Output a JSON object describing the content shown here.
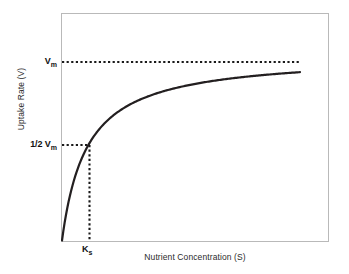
{
  "chart_data": {
    "type": "line",
    "title": "",
    "subtitle": "",
    "xlabel": "Nutrient Concentration (S)",
    "ylabel": "Uptake Rate (V)",
    "grid": false,
    "legend": null,
    "axes": {
      "x_ticks": [
        "K"
      ],
      "x_tick_subscripts": [
        "s"
      ],
      "y_ticks": [
        "V",
        "1/2 V"
      ],
      "y_tick_subscripts": [
        "m",
        "m"
      ],
      "xlim": [
        0,
        1
      ],
      "ylim": [
        0,
        1
      ],
      "tick_marks_shown": false,
      "numeric_ticks_shown": false
    },
    "model": "Michaelis-Menten saturation (Monod) curve",
    "equation": "V = Vm * S / (Ks + S)",
    "parameters": {
      "Vm_normalized": 1.0,
      "Ks_normalized": 0.105,
      "half_saturation_y": 0.5
    },
    "series": [
      {
        "name": "Uptake rate",
        "style": "solid",
        "color": "#231f20",
        "x": [
          0.0,
          0.01,
          0.02,
          0.03,
          0.05,
          0.07,
          0.105,
          0.14,
          0.18,
          0.23,
          0.3,
          0.38,
          0.47,
          0.58,
          0.7,
          0.82,
          0.9,
          1.0
        ],
        "y": [
          0.0,
          0.087,
          0.16,
          0.222,
          0.323,
          0.4,
          0.5,
          0.571,
          0.632,
          0.687,
          0.741,
          0.784,
          0.817,
          0.847,
          0.87,
          0.886,
          0.895,
          0.905
        ]
      }
    ],
    "annotations": [
      {
        "name": "vmax-guide",
        "style": "dotted",
        "orientation": "horizontal",
        "label": "Vm",
        "y_value": 1.0,
        "x_from": 0.0,
        "x_to": 0.905
      },
      {
        "name": "half-vmax-guide",
        "style": "dotted",
        "orientation": "horizontal",
        "label": "1/2 Vm",
        "y_value": 0.5,
        "x_from": 0.0,
        "x_to": 0.105
      },
      {
        "name": "ks-guide",
        "style": "dotted",
        "orientation": "vertical",
        "label": "Ks",
        "x_value": 0.105,
        "y_from": 0.0,
        "y_to": 0.5
      }
    ]
  },
  "labels": {
    "x_axis_title": "Nutrient Concentration (S)",
    "y_axis_title": "Uptake Rate (V)",
    "vmax_main": "V",
    "vmax_sub": "m",
    "half_vmax_frac": "1/2",
    "half_vmax_main": "V",
    "half_vmax_sub": "m",
    "ks_main": "K",
    "ks_sub": "s"
  },
  "colors": {
    "background": "#ffffff",
    "frame": "#b9b9b9",
    "curve": "#231f20",
    "guide_line": "#1a1a1a",
    "text": "#2b2b2b",
    "tick_text": "#111111"
  }
}
